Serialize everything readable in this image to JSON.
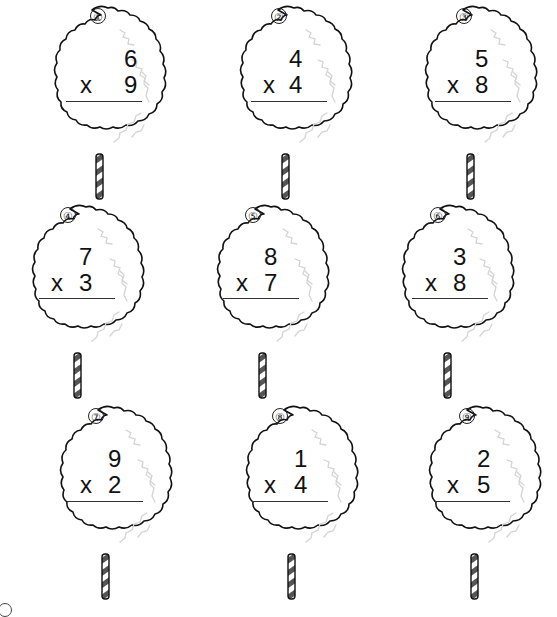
{
  "worksheet": {
    "operator_symbol": "x",
    "problems": [
      {
        "label": "①",
        "top": "6",
        "bottom": "9"
      },
      {
        "label": "②",
        "top": "4",
        "bottom": "4"
      },
      {
        "label": "③",
        "top": "5",
        "bottom": "8"
      },
      {
        "label": "④",
        "top": "7",
        "bottom": "3"
      },
      {
        "label": "⑤",
        "top": "8",
        "bottom": "7"
      },
      {
        "label": "⑥",
        "top": "3",
        "bottom": "8"
      },
      {
        "label": "⑦",
        "top": "9",
        "bottom": "2"
      },
      {
        "label": "⑧",
        "top": "1",
        "bottom": "4"
      },
      {
        "label": "⑨",
        "top": "2",
        "bottom": "5"
      }
    ]
  },
  "colors": {
    "outline": "#111111",
    "shading": "#d8d8d8",
    "stick_stripe": "#555555",
    "background": "#ffffff"
  },
  "icons": {
    "cloud": "cotton-candy-icon",
    "stick": "striped-stick-icon"
  }
}
